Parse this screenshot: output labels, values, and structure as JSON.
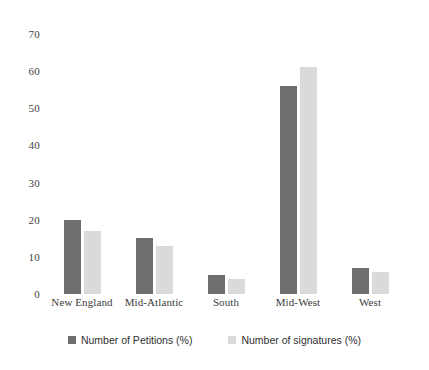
{
  "chart_data": {
    "type": "bar",
    "title": "",
    "xlabel": "",
    "ylabel": "",
    "ylim": [
      0,
      70
    ],
    "yticks": [
      70,
      60,
      50,
      40,
      30,
      20,
      10,
      0
    ],
    "grid": false,
    "legend_position": "bottom",
    "categories": [
      "New England",
      "Mid-Atlantic",
      "South",
      "Mid-West",
      "West"
    ],
    "series": [
      {
        "name": "Number of Petitions (%)",
        "color": "#6e6e6e",
        "values": [
          20,
          15,
          5,
          56,
          7
        ]
      },
      {
        "name": "Number of signatures (%)",
        "color": "#dadada",
        "values": [
          17,
          13,
          4,
          61,
          6
        ]
      }
    ]
  },
  "legend": {
    "entries": [
      {
        "label": "Number of Petitions (%)",
        "swatch": "#6e6e6e"
      },
      {
        "label": "Number of signatures (%)",
        "swatch": "#dadada"
      }
    ]
  }
}
